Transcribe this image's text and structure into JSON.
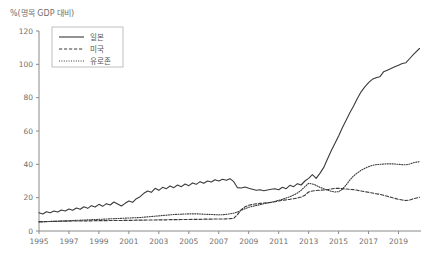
{
  "chart_data": {
    "type": "line",
    "title": "",
    "ylabel": "%(명목 GDP 대비)",
    "xlabel": "",
    "ylim": [
      0,
      120
    ],
    "xlim": [
      1995,
      2020.5
    ],
    "yticks": [
      0,
      20,
      40,
      60,
      80,
      100,
      120
    ],
    "ytick_labels": [
      "0",
      "20",
      "40",
      "60",
      "80",
      "100",
      "120"
    ],
    "xticks": [
      1995,
      1997,
      1999,
      2001,
      2003,
      2005,
      2007,
      2009,
      2011,
      2013,
      2015,
      2017,
      2019
    ],
    "xtick_labels": [
      "1995",
      "1997",
      "1999",
      "2001",
      "2003",
      "2005",
      "2007",
      "2009",
      "2011",
      "2013",
      "2015",
      "2017",
      "2019"
    ],
    "grid": false,
    "legend_position": "upper-left",
    "x": [
      1995.0,
      1995.25,
      1995.5,
      1995.75,
      1996.0,
      1996.25,
      1996.5,
      1996.75,
      1997.0,
      1997.25,
      1997.5,
      1997.75,
      1998.0,
      1998.25,
      1998.5,
      1998.75,
      1999.0,
      1999.25,
      1999.5,
      1999.75,
      2000.0,
      2000.25,
      2000.5,
      2000.75,
      2001.0,
      2001.25,
      2001.5,
      2001.75,
      2002.0,
      2002.25,
      2002.5,
      2002.75,
      2003.0,
      2003.25,
      2003.5,
      2003.75,
      2004.0,
      2004.25,
      2004.5,
      2004.75,
      2005.0,
      2005.25,
      2005.5,
      2005.75,
      2006.0,
      2006.25,
      2006.5,
      2006.75,
      2007.0,
      2007.25,
      2007.5,
      2007.75,
      2008.0,
      2008.25,
      2008.5,
      2008.75,
      2009.0,
      2009.25,
      2009.5,
      2009.75,
      2010.0,
      2010.25,
      2010.5,
      2010.75,
      2011.0,
      2011.25,
      2011.5,
      2011.75,
      2012.0,
      2012.25,
      2012.5,
      2012.75,
      2013.0,
      2013.25,
      2013.5,
      2013.75,
      2014.0,
      2014.25,
      2014.5,
      2014.75,
      2015.0,
      2015.25,
      2015.5,
      2015.75,
      2016.0,
      2016.25,
      2016.5,
      2016.75,
      2017.0,
      2017.25,
      2017.5,
      2017.75,
      2018.0,
      2018.25,
      2018.5,
      2018.75,
      2019.0,
      2019.25,
      2019.5,
      2019.75,
      2020.0,
      2020.4
    ],
    "series": [
      {
        "name": "일본",
        "style": "solid",
        "color": "#3a3a3a",
        "values": [
          11.0,
          10.2,
          11.5,
          11.0,
          12.0,
          11.4,
          12.6,
          12.0,
          13.2,
          12.5,
          13.8,
          13.0,
          14.5,
          13.6,
          15.2,
          14.4,
          16.0,
          14.8,
          16.4,
          15.6,
          17.4,
          16.2,
          15.0,
          16.6,
          18.0,
          17.2,
          19.4,
          20.6,
          22.6,
          24.0,
          23.2,
          25.6,
          24.4,
          26.2,
          25.4,
          27.0,
          26.0,
          27.6,
          26.6,
          28.2,
          27.2,
          28.8,
          28.0,
          29.6,
          28.6,
          30.0,
          29.4,
          30.8,
          30.0,
          31.0,
          30.4,
          31.4,
          29.6,
          26.0,
          25.8,
          26.4,
          25.6,
          25.0,
          24.4,
          24.8,
          24.2,
          24.6,
          25.0,
          25.4,
          24.8,
          26.2,
          25.4,
          27.4,
          26.6,
          28.4,
          27.6,
          30.0,
          31.6,
          33.8,
          31.6,
          34.6,
          38.0,
          43.0,
          48.0,
          52.5,
          57.0,
          62.0,
          66.5,
          71.0,
          75.0,
          79.5,
          83.5,
          86.5,
          89.0,
          91.0,
          92.0,
          92.5,
          95.5,
          96.5,
          97.5,
          98.5,
          99.5,
          100.5,
          101.0,
          103.5,
          106.0,
          109.5
        ]
      },
      {
        "name": "미국",
        "style": "dashed",
        "color": "#3a3a3a",
        "values": [
          5.6,
          5.6,
          5.7,
          5.7,
          5.8,
          5.8,
          5.9,
          5.9,
          5.9,
          6.0,
          6.0,
          6.0,
          6.1,
          6.1,
          6.1,
          6.2,
          6.2,
          6.2,
          6.2,
          6.3,
          6.3,
          6.3,
          6.3,
          6.4,
          6.4,
          6.4,
          6.5,
          6.5,
          6.5,
          6.6,
          6.6,
          6.6,
          6.7,
          6.7,
          6.7,
          6.8,
          6.8,
          6.8,
          6.9,
          6.9,
          6.9,
          7.0,
          7.0,
          7.0,
          7.1,
          7.1,
          7.1,
          7.2,
          7.2,
          7.2,
          7.3,
          7.4,
          7.6,
          9.8,
          12.8,
          14.5,
          15.4,
          15.9,
          16.3,
          16.6,
          16.8,
          17.0,
          17.2,
          17.6,
          18.0,
          18.4,
          18.7,
          19.0,
          19.4,
          19.8,
          20.4,
          21.4,
          23.4,
          24.0,
          24.3,
          24.5,
          24.6,
          24.8,
          25.2,
          25.6,
          25.6,
          25.4,
          25.2,
          25.0,
          24.8,
          24.4,
          24.0,
          23.6,
          23.2,
          22.8,
          22.4,
          22.0,
          21.4,
          20.8,
          20.2,
          19.6,
          19.0,
          18.6,
          18.3,
          18.6,
          19.4,
          20.2
        ]
      },
      {
        "name": "유로존",
        "style": "dotted",
        "color": "#3a3a3a",
        "values": [
          5.4,
          5.5,
          5.6,
          5.7,
          5.8,
          5.9,
          6.0,
          6.1,
          6.2,
          6.3,
          6.4,
          6.5,
          6.6,
          6.7,
          6.8,
          6.9,
          7.0,
          7.1,
          7.2,
          7.3,
          7.4,
          7.5,
          7.6,
          7.7,
          7.8,
          7.9,
          8.0,
          8.1,
          8.3,
          8.5,
          8.7,
          8.9,
          9.1,
          9.3,
          9.5,
          9.7,
          9.9,
          10.0,
          10.1,
          10.2,
          10.3,
          10.3,
          10.3,
          10.2,
          10.1,
          10.0,
          9.9,
          9.8,
          9.7,
          9.8,
          10.0,
          10.3,
          10.7,
          11.4,
          12.4,
          13.4,
          14.2,
          14.8,
          15.3,
          15.8,
          16.3,
          16.8,
          17.3,
          17.8,
          18.4,
          19.0,
          19.8,
          20.6,
          21.6,
          22.8,
          24.4,
          26.6,
          28.6,
          28.2,
          27.4,
          26.2,
          25.4,
          24.6,
          23.8,
          23.4,
          23.6,
          25.0,
          27.6,
          30.6,
          33.0,
          34.8,
          36.4,
          37.6,
          38.6,
          39.4,
          39.8,
          40.0,
          40.2,
          40.3,
          40.3,
          40.2,
          40.0,
          39.8,
          39.7,
          40.2,
          41.0,
          41.6
        ]
      }
    ]
  },
  "legend": {
    "items": [
      {
        "label": "일본"
      },
      {
        "label": "미국"
      },
      {
        "label": "유로존"
      }
    ]
  }
}
